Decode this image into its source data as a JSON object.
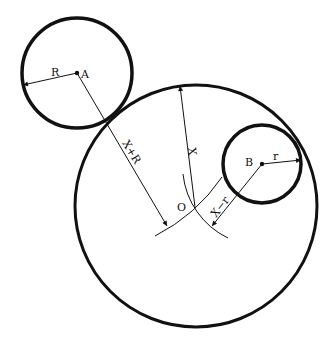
{
  "diagram": {
    "stroke_color": "#111111",
    "background": "#ffffff",
    "circles": [
      {
        "id": "circle-A",
        "cx": 77,
        "cy": 73,
        "r": 55,
        "stroke_width": 3.5
      },
      {
        "id": "circle-B",
        "cx": 262,
        "cy": 164,
        "r": 39,
        "stroke_width": 3.5
      },
      {
        "id": "circle-O",
        "cx": 196,
        "cy": 206,
        "r": 121,
        "stroke_width": 3
      }
    ],
    "points": [
      {
        "id": "A",
        "label": "A",
        "x": 77,
        "y": 73
      },
      {
        "id": "B",
        "label": "B",
        "x": 262,
        "y": 164
      },
      {
        "id": "O",
        "label": "O",
        "x": 195,
        "y": 207
      }
    ],
    "labels": {
      "A": "A",
      "B": "B",
      "O": "O",
      "R": "R",
      "r": "r",
      "X": "X",
      "X_plus_R": "X+R",
      "X_minus_r": "X−r"
    },
    "dimensions": [
      {
        "id": "radius-R",
        "label": "R",
        "from": "A",
        "to": [
          23,
          85
        ]
      },
      {
        "id": "radius-r",
        "label": "r",
        "from": "B",
        "to": [
          301,
          160
        ]
      },
      {
        "id": "radius-X",
        "label": "X",
        "from": "O",
        "to": [
          180,
          86
        ]
      },
      {
        "id": "dist-X-plus-R",
        "label": "X+R",
        "from": "A",
        "to": [
          167,
          226
        ]
      },
      {
        "id": "dist-X-minus-r",
        "label": "X−r",
        "from": "B",
        "to": [
          212,
          226
        ]
      }
    ],
    "arcs": [
      {
        "id": "arc-about-A",
        "center": "A",
        "radius": "X+R"
      },
      {
        "id": "arc-about-B",
        "center": "B",
        "radius": "X−r"
      }
    ]
  }
}
